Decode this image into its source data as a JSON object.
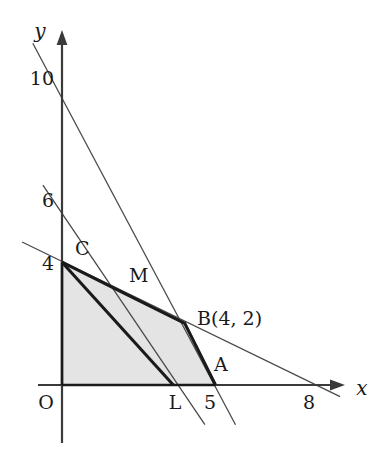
{
  "figure": {
    "background_color": "#ffffff",
    "axis_color": "#3a3a3a",
    "thin_line_color": "#4a4a4a",
    "thick_line_color": "#1a1a1a",
    "shade_fill": "#e4e4e4"
  },
  "axes": {
    "x_label": "x",
    "y_label": "y",
    "origin_label": "O",
    "x_ticks": [
      {
        "value": 5,
        "label": "5"
      },
      {
        "value": 8,
        "label": "8"
      }
    ],
    "y_ticks": [
      {
        "value": 4,
        "label": "4"
      },
      {
        "value": 6,
        "label": "6"
      },
      {
        "value": 10,
        "label": "10"
      }
    ]
  },
  "points": [
    {
      "name": "O",
      "label": "O",
      "x": 0,
      "y": 0
    },
    {
      "name": "C",
      "label": "C",
      "x": 0,
      "y": 4
    },
    {
      "name": "M",
      "label": "M",
      "x": 2,
      "y": 3
    },
    {
      "name": "B",
      "label": "B(4, 2)",
      "x": 4,
      "y": 2
    },
    {
      "name": "A",
      "label": "A",
      "x": 5,
      "y": 0
    },
    {
      "name": "L",
      "label": "L",
      "x": 3.6,
      "y": 0
    }
  ],
  "lines": [
    {
      "name": "line-2x-plus-y-10",
      "style": "thin",
      "from": {
        "x": -0.95,
        "y": 11.2
      },
      "to": {
        "x": 5.65,
        "y": -1.3
      }
    },
    {
      "name": "line-through-0-6-and-B",
      "style": "thin",
      "from": {
        "x": -0.62,
        "y": 6.55
      },
      "to": {
        "x": 4.62,
        "y": -1.3
      }
    },
    {
      "name": "line-x-plus-2y-8",
      "style": "thin",
      "from": {
        "x": -1.3,
        "y": 4.65
      },
      "to": {
        "x": 9.05,
        "y": -0.38
      }
    }
  ],
  "region": {
    "name": "feasible-region",
    "vertices": [
      {
        "x": 0,
        "y": 0
      },
      {
        "x": 0,
        "y": 4
      },
      {
        "x": 2,
        "y": 3
      },
      {
        "x": 4,
        "y": 2
      },
      {
        "x": 5,
        "y": 0
      }
    ]
  },
  "objective_line": {
    "name": "objective-line-C-M-L",
    "from": {
      "x": 0,
      "y": 4
    },
    "to": {
      "x": 3.62,
      "y": 0
    }
  }
}
